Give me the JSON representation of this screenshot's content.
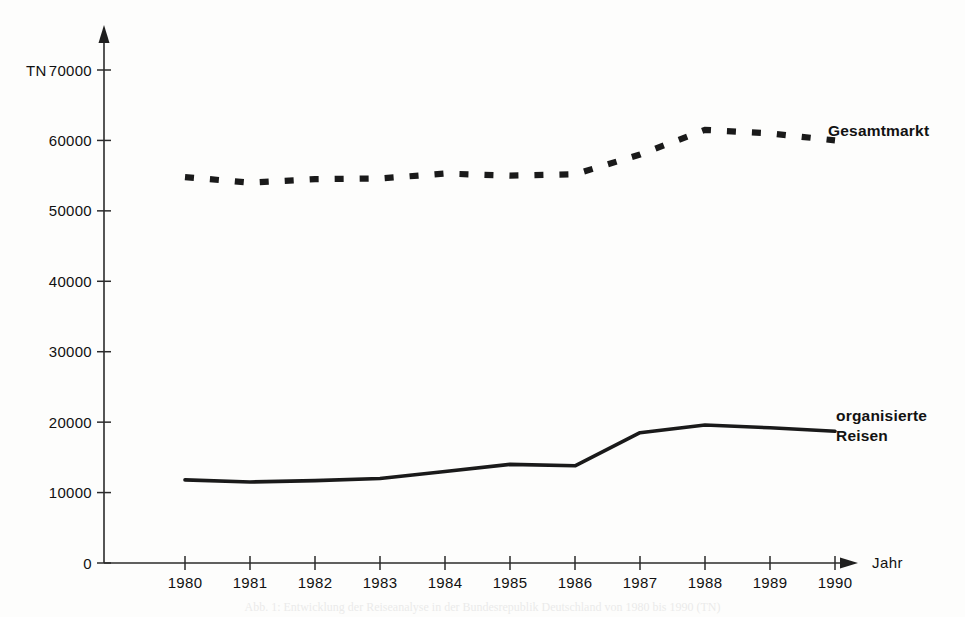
{
  "figure": {
    "background_color": "#fdfdfc",
    "ink_color": "#1a1a1a"
  },
  "axes": {
    "y_axis_name": "TN",
    "x_axis_name": "Jahr",
    "y_ticks": [
      "0",
      "10000",
      "20000",
      "30000",
      "40000",
      "50000",
      "60000",
      "70000"
    ],
    "x_ticks": [
      "1980",
      "1981",
      "1982",
      "1983",
      "1984",
      "1985",
      "1986",
      "1987",
      "1988",
      "1989",
      "1990"
    ]
  },
  "series_labels": {
    "gesamtmarkt": "Gesamtmarkt",
    "organisierte_line1": "organisierte",
    "organisierte_line2": "Reisen"
  },
  "caption": {
    "text": "Abb. 1:  Entwicklung der Reiseanalyse in der Bundesrepublik Deutschland von 1980 bis 1990 (TN)"
  },
  "chart_data": {
    "type": "line",
    "title": "",
    "xlabel": "Jahr",
    "ylabel": "TN",
    "xlim": [
      1980,
      1990
    ],
    "ylim": [
      0,
      70000
    ],
    "grid": false,
    "legend_position": "right-inline",
    "x": [
      1980,
      1981,
      1982,
      1983,
      1984,
      1985,
      1986,
      1987,
      1988,
      1989,
      1990
    ],
    "series": [
      {
        "name": "Gesamtmarkt",
        "style": "dashed",
        "values": [
          54800,
          54000,
          54500,
          54600,
          55300,
          55000,
          55200,
          58000,
          61500,
          61000,
          60000
        ]
      },
      {
        "name": "organisierte Reisen",
        "style": "solid",
        "values": [
          11800,
          11500,
          11700,
          12000,
          13000,
          14000,
          13800,
          18500,
          19600,
          19200,
          18700
        ]
      }
    ]
  }
}
